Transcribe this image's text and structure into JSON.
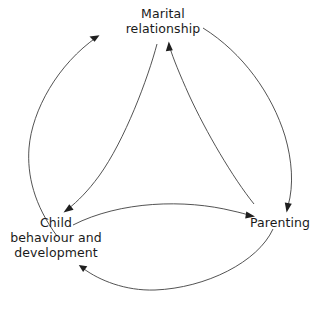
{
  "diagram": {
    "background_color": "#ffffff",
    "line_color": "#404040",
    "text_color": "#1a1a1a",
    "nodes": [
      {
        "id": "marital",
        "label": "Marital relationship",
        "lines": [
          "Marital",
          "relationship"
        ],
        "position": "top"
      },
      {
        "id": "child",
        "label": "Child behaviour and development",
        "lines": [
          "Child",
          "behaviour and",
          "development"
        ],
        "position": "bottom-left"
      },
      {
        "id": "parenting",
        "label": "Parenting",
        "lines": [
          "Parenting"
        ],
        "position": "bottom-right"
      }
    ],
    "edges": [
      {
        "id": "child-to-marital",
        "from": "child",
        "to": "marital",
        "route": "outer-left",
        "direction": "up"
      },
      {
        "id": "marital-to-child",
        "from": "marital",
        "to": "child",
        "route": "inner-left",
        "direction": "down"
      },
      {
        "id": "marital-to-parenting",
        "from": "marital",
        "to": "parenting",
        "route": "outer-right",
        "direction": "down"
      },
      {
        "id": "parenting-to-marital",
        "from": "parenting",
        "to": "marital",
        "route": "inner-right",
        "direction": "up"
      },
      {
        "id": "child-to-parenting",
        "from": "child",
        "to": "parenting",
        "route": "inner-bottom",
        "direction": "right"
      },
      {
        "id": "parenting-to-child",
        "from": "parenting",
        "to": "child",
        "route": "outer-bottom",
        "direction": "left"
      }
    ]
  }
}
